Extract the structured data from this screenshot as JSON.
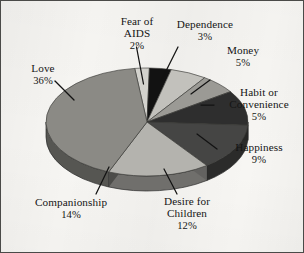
{
  "figure": {
    "background_color": "#f6f5f2",
    "border_color": "#4a4a48"
  },
  "chart_data": {
    "type": "pie",
    "title": "",
    "subtitle": "",
    "xlabel": "",
    "ylabel": "",
    "legend_position": "none",
    "grid": false,
    "style": "3d-pie-grayscale",
    "units": "percent",
    "total": 100,
    "categories": [
      "Fear of AIDS",
      "Dependence",
      "Money",
      "Habit or Convenience",
      "Happiness",
      "Desire for Children",
      "Companionship",
      "Love"
    ],
    "values": [
      2,
      3,
      5,
      5,
      9,
      12,
      14,
      36
    ],
    "colors": [
      "#d3d2cd",
      "#121212",
      "#c2c1bc",
      "#9b9a95",
      "#2e2e2e",
      "#454544",
      "#b4b3ae",
      "#8b8a85"
    ],
    "slices": [
      {
        "label": "Fear of AIDS",
        "line1": "Fear of",
        "line2": "AIDS",
        "value": 2,
        "pct_text": "2%",
        "color": "#d3d2cd"
      },
      {
        "label": "Dependence",
        "line1": "Dependence",
        "line2": "",
        "value": 3,
        "pct_text": "3%",
        "color": "#121212"
      },
      {
        "label": "Money",
        "line1": "Money",
        "line2": "",
        "value": 5,
        "pct_text": "5%",
        "color": "#c2c1bc"
      },
      {
        "label": "Habit or Convenience",
        "line1": "Habit or",
        "line2": "Convenience",
        "value": 5,
        "pct_text": "5%",
        "color": "#9b9a95"
      },
      {
        "label": "Happiness",
        "line1": "Happiness",
        "line2": "",
        "value": 9,
        "pct_text": "9%",
        "color": "#2e2e2e"
      },
      {
        "label": "Desire for Children",
        "line1": "Desire for",
        "line2": "Children",
        "value": 12,
        "pct_text": "12%",
        "color": "#454544"
      },
      {
        "label": "Companionship",
        "line1": "Companionship",
        "line2": "",
        "value": 14,
        "pct_text": "14%",
        "color": "#b4b3ae"
      },
      {
        "label": "Love",
        "line1": "Love",
        "line2": "",
        "value": 36,
        "pct_text": "36%",
        "color": "#8b8a85"
      }
    ]
  }
}
